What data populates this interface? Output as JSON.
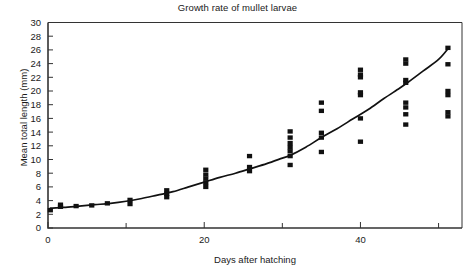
{
  "chart_data": {
    "type": "scatter",
    "title": "Growth rate of mullet larvae",
    "xlabel": "Days after hatching",
    "ylabel": "Mean total length (mm)",
    "xlim": [
      0,
      53
    ],
    "ylim": [
      0,
      30
    ],
    "grid": false,
    "legend": null,
    "x_major_ticks": [
      0,
      20,
      40
    ],
    "x_major_tick_labels": [
      "0",
      "20",
      "40"
    ],
    "x_minor_ticks": [
      10,
      30,
      50
    ],
    "y_ticks": [
      0,
      2,
      4,
      6,
      8,
      10,
      12,
      14,
      16,
      18,
      20,
      22,
      24,
      26,
      28,
      30
    ],
    "y_tick_labels": [
      "0",
      "2",
      "4",
      "6",
      "8",
      "10",
      "12",
      "14",
      "16",
      "18",
      "20",
      "22",
      "24",
      "26",
      "28",
      "30"
    ],
    "marker": "square",
    "marker_color": "#111111",
    "line_color": "#111111",
    "axis_color": "#333333",
    "background_color": "#ffffff",
    "series": [
      {
        "name": "Observed lengths",
        "type": "scatter",
        "points": [
          {
            "x": 0.3,
            "y": 2.6
          },
          {
            "x": 1.6,
            "y": 3.1
          },
          {
            "x": 1.6,
            "y": 3.4
          },
          {
            "x": 3.6,
            "y": 3.2
          },
          {
            "x": 5.6,
            "y": 3.3
          },
          {
            "x": 7.6,
            "y": 3.6
          },
          {
            "x": 10.5,
            "y": 3.5
          },
          {
            "x": 10.5,
            "y": 4.1
          },
          {
            "x": 15.2,
            "y": 4.5
          },
          {
            "x": 15.2,
            "y": 5.0
          },
          {
            "x": 15.2,
            "y": 5.5
          },
          {
            "x": 20.2,
            "y": 6.0
          },
          {
            "x": 20.2,
            "y": 6.6
          },
          {
            "x": 20.2,
            "y": 7.2
          },
          {
            "x": 20.2,
            "y": 7.8
          },
          {
            "x": 20.2,
            "y": 8.5
          },
          {
            "x": 25.8,
            "y": 8.3
          },
          {
            "x": 25.8,
            "y": 8.9
          },
          {
            "x": 25.8,
            "y": 10.5
          },
          {
            "x": 31.0,
            "y": 9.2
          },
          {
            "x": 31.0,
            "y": 10.5
          },
          {
            "x": 31.0,
            "y": 11.2
          },
          {
            "x": 31.0,
            "y": 11.8
          },
          {
            "x": 31.0,
            "y": 12.4
          },
          {
            "x": 31.0,
            "y": 13.2
          },
          {
            "x": 31.0,
            "y": 14.1
          },
          {
            "x": 35.0,
            "y": 11.1
          },
          {
            "x": 35.0,
            "y": 13.2
          },
          {
            "x": 35.0,
            "y": 13.9
          },
          {
            "x": 35.0,
            "y": 17.1
          },
          {
            "x": 35.0,
            "y": 18.3
          },
          {
            "x": 40.0,
            "y": 12.6
          },
          {
            "x": 40.0,
            "y": 16.0
          },
          {
            "x": 40.0,
            "y": 19.4
          },
          {
            "x": 40.0,
            "y": 19.8
          },
          {
            "x": 40.0,
            "y": 22.0
          },
          {
            "x": 40.0,
            "y": 22.4
          },
          {
            "x": 40.0,
            "y": 23.1
          },
          {
            "x": 45.8,
            "y": 15.1
          },
          {
            "x": 45.8,
            "y": 16.6
          },
          {
            "x": 45.8,
            "y": 17.6
          },
          {
            "x": 45.8,
            "y": 18.3
          },
          {
            "x": 45.8,
            "y": 21.2
          },
          {
            "x": 45.8,
            "y": 21.6
          },
          {
            "x": 45.8,
            "y": 24.0
          },
          {
            "x": 45.8,
            "y": 24.6
          },
          {
            "x": 51.2,
            "y": 16.3
          },
          {
            "x": 51.2,
            "y": 16.9
          },
          {
            "x": 51.2,
            "y": 19.4
          },
          {
            "x": 51.2,
            "y": 20.0
          },
          {
            "x": 51.2,
            "y": 23.9
          },
          {
            "x": 51.2,
            "y": 26.3
          }
        ]
      },
      {
        "name": "Fitted growth curve",
        "type": "line",
        "points": [
          {
            "x": 0.3,
            "y": 2.9
          },
          {
            "x": 2,
            "y": 3.0
          },
          {
            "x": 4,
            "y": 3.2
          },
          {
            "x": 6,
            "y": 3.4
          },
          {
            "x": 8,
            "y": 3.6
          },
          {
            "x": 10,
            "y": 3.9
          },
          {
            "x": 12,
            "y": 4.3
          },
          {
            "x": 14,
            "y": 4.8
          },
          {
            "x": 16,
            "y": 5.3
          },
          {
            "x": 18,
            "y": 6.0
          },
          {
            "x": 20,
            "y": 6.7
          },
          {
            "x": 22,
            "y": 7.4
          },
          {
            "x": 24,
            "y": 8.0
          },
          {
            "x": 26,
            "y": 8.7
          },
          {
            "x": 28,
            "y": 9.4
          },
          {
            "x": 30,
            "y": 10.2
          },
          {
            "x": 31,
            "y": 10.6
          },
          {
            "x": 33,
            "y": 11.8
          },
          {
            "x": 35,
            "y": 13.2
          },
          {
            "x": 37,
            "y": 14.5
          },
          {
            "x": 39,
            "y": 15.9
          },
          {
            "x": 41,
            "y": 17.3
          },
          {
            "x": 43,
            "y": 18.9
          },
          {
            "x": 45,
            "y": 20.4
          },
          {
            "x": 46,
            "y": 21.2
          },
          {
            "x": 48,
            "y": 22.9
          },
          {
            "x": 50,
            "y": 24.6
          },
          {
            "x": 51.3,
            "y": 26.3
          }
        ]
      }
    ]
  }
}
